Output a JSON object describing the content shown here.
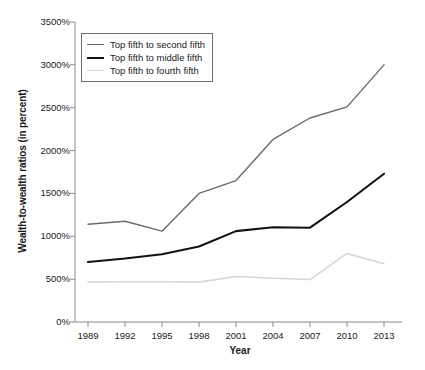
{
  "chart_data": {
    "type": "line",
    "title": "",
    "xlabel": "Year",
    "ylabel": "Wealth-to-wealth ratios (in percent)",
    "x": [
      1989,
      1992,
      1995,
      1998,
      2001,
      2004,
      2007,
      2010,
      2013
    ],
    "xtick_labels": [
      "1989",
      "1992",
      "1995",
      "1998",
      "2001",
      "2004",
      "2007",
      "2010",
      "2013"
    ],
    "ytick_labels": [
      "0%",
      "500%",
      "1000%",
      "1500%",
      "2000%",
      "2500%",
      "3000%",
      "3500%"
    ],
    "ytick_values": [
      0,
      500,
      1000,
      1500,
      2000,
      2500,
      3000,
      3500
    ],
    "ylim": [
      0,
      3500
    ],
    "xlim": [
      1989,
      2013
    ],
    "grid": false,
    "legend_position": "upper-left",
    "series": [
      {
        "name": "Top fifth to second fifth",
        "color": "#6b6b6b",
        "width": 1.4,
        "values": [
          1140,
          1175,
          1060,
          1500,
          1650,
          2130,
          2380,
          2510,
          3000
        ]
      },
      {
        "name": "Top fifth to middle fifth",
        "color": "#121212",
        "width": 2.1,
        "values": [
          700,
          740,
          790,
          880,
          1060,
          1105,
          1100,
          1400,
          1730
        ]
      },
      {
        "name": "Top fifth to fourth fifth",
        "color": "#d6d6d6",
        "width": 1.6,
        "values": [
          465,
          470,
          470,
          465,
          530,
          510,
          495,
          800,
          680
        ]
      }
    ]
  },
  "axes": {
    "axis_color": "#8a8a8a"
  }
}
